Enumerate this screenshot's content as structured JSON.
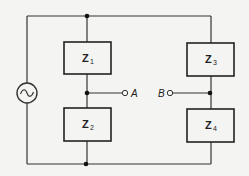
{
  "diagram": {
    "type": "impedance-bridge-circuit",
    "source": {
      "symbol": "ac-source-icon",
      "glyph": "~"
    },
    "impedances": [
      {
        "id": "Z1",
        "letter": "Z",
        "subscript": "1",
        "branch": "left",
        "position": "top"
      },
      {
        "id": "Z2",
        "letter": "Z",
        "subscript": "2",
        "branch": "left",
        "position": "bottom"
      },
      {
        "id": "Z3",
        "letter": "Z",
        "subscript": "3",
        "branch": "right",
        "position": "top"
      },
      {
        "id": "Z4",
        "letter": "Z",
        "subscript": "4",
        "branch": "right",
        "position": "bottom"
      }
    ],
    "terminals": [
      {
        "id": "A",
        "label": "A",
        "connects": "junction between Z1 and Z2"
      },
      {
        "id": "B",
        "label": "B",
        "connects": "junction between Z3 and Z4"
      }
    ],
    "colors": {
      "line": "#333333",
      "background": "#f4f4f2"
    }
  }
}
